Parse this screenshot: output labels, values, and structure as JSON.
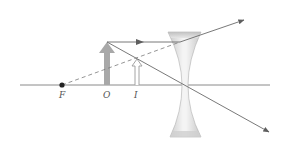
{
  "diagram": {
    "labels": {
      "focal_point": "F",
      "object": "O",
      "image": "I"
    },
    "colors": {
      "background": "#ffffff",
      "axis": "#8a8a8a",
      "ray": "#6a6a6a",
      "object_arrow": "#a8a8a8",
      "image_arrow_fill": "#ffffff",
      "image_arrow_stroke": "#9a9a9a",
      "lens_fill": "#e4e4e4",
      "lens_edge": "#b0b0b0",
      "focal_dot": "#222222"
    },
    "elements": {
      "optical_axis": "horizontal principal axis",
      "lens": "diverging (concave) lens",
      "rays": [
        "parallel ray refracted away from axis, extended back to F (dashed)",
        "ray through lens center, undeviated"
      ]
    }
  }
}
